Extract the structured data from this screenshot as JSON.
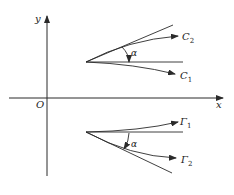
{
  "diagram": {
    "axes": {
      "x_label": "x",
      "y_label": "y",
      "origin_label": "O"
    },
    "upper_figure": {
      "angle_label": "α",
      "curve_labels": [
        "C₂",
        "C₁"
      ],
      "curve_label_main": [
        "C",
        "C"
      ],
      "curve_label_sub": [
        "2",
        "1"
      ]
    },
    "lower_figure": {
      "angle_label": "α",
      "curve_label_main": [
        "Γ",
        "Γ"
      ],
      "curve_label_sub": [
        "1",
        "2"
      ]
    },
    "colors": {
      "stroke": "#2a2a2a",
      "background": "#ffffff"
    }
  }
}
